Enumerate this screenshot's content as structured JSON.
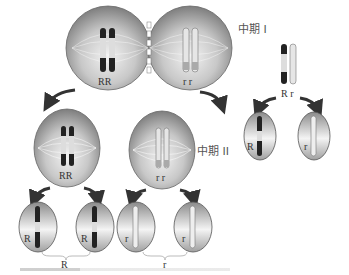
{
  "diagram": {
    "type": "meiosis-allele-segregation",
    "stage_labels": {
      "meta1": "中期 I",
      "meta2": "中期 II"
    },
    "top_cell": {
      "left_alleles": "RR",
      "right_alleles": "r r"
    },
    "meta2_cells": [
      {
        "alleles": "RR"
      },
      {
        "alleles": "r r"
      }
    ],
    "gametes": [
      {
        "allele": "R"
      },
      {
        "allele": "R"
      },
      {
        "allele": "r"
      },
      {
        "allele": "r"
      }
    ],
    "group_labels": [
      "R",
      "r"
    ],
    "side_panel": {
      "pair_label": "R r",
      "gametes": [
        {
          "allele": "R"
        },
        {
          "allele": "r"
        }
      ]
    },
    "colors": {
      "cell_fill": "#9a9a9a",
      "cell_light": "#e8e8e8",
      "dark_chromosome": "#222222",
      "light_chromosome": "#bdbdbd",
      "arrow": "#333333"
    }
  }
}
